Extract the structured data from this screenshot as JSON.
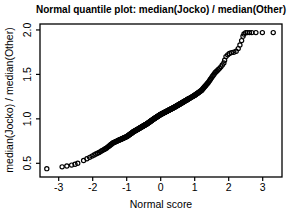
{
  "figure": {
    "background": "#ffffff",
    "box_color": "#000000",
    "marker_color": "#000000"
  },
  "chart_data": {
    "type": "scatter",
    "title": "Normal quantile plot: median(Jocko) / median(Other)",
    "xlabel": "Normal score",
    "ylabel": "median(Jocko) / median(Other)",
    "x_ticks": [
      -3,
      -2,
      -1,
      0,
      1,
      2,
      3
    ],
    "x_tick_labels": [
      "-3",
      "-2",
      "-1",
      "0",
      "1",
      "2",
      "3"
    ],
    "y_ticks": [
      0.5,
      1.0,
      1.5,
      2.0
    ],
    "y_tick_labels": [
      "0.5",
      "1.0",
      "1.5",
      "2.0"
    ],
    "xlim": [
      -3.55,
      3.57
    ],
    "ylim": [
      0.35,
      2.07
    ],
    "grid": false,
    "legend": null,
    "marker": "open-circle",
    "lower_outliers": [
      [
        -3.35,
        0.44
      ],
      [
        -2.9,
        0.46
      ],
      [
        -2.76,
        0.47
      ],
      [
        -2.62,
        0.48
      ],
      [
        -2.52,
        0.49
      ],
      [
        -2.44,
        0.5
      ]
    ],
    "upper_points": [
      [
        1.88,
        1.66
      ],
      [
        1.92,
        1.7
      ],
      [
        1.97,
        1.72
      ],
      [
        2.02,
        1.735
      ],
      [
        2.08,
        1.745
      ],
      [
        2.15,
        1.75
      ],
      [
        2.22,
        1.76
      ],
      [
        2.28,
        1.79
      ],
      [
        2.33,
        1.83
      ],
      [
        2.38,
        1.88
      ],
      [
        2.42,
        1.93
      ],
      [
        2.45,
        1.955
      ],
      [
        2.5,
        1.97
      ],
      [
        2.55,
        1.97
      ],
      [
        2.61,
        1.97
      ],
      [
        2.68,
        1.97
      ],
      [
        2.8,
        1.97
      ],
      [
        2.99,
        1.97
      ],
      [
        3.31,
        1.97
      ]
    ],
    "band": {
      "n_points": 300,
      "x_range": [
        -2.38,
        1.86
      ],
      "curve": [
        [
          -2.38,
          0.51
        ],
        [
          -2.2,
          0.545
        ],
        [
          -2.0,
          0.585
        ],
        [
          -1.8,
          0.625
        ],
        [
          -1.6,
          0.67
        ],
        [
          -1.5,
          0.7
        ],
        [
          -1.4,
          0.73
        ],
        [
          -1.2,
          0.765
        ],
        [
          -1.0,
          0.8
        ],
        [
          -0.8,
          0.855
        ],
        [
          -0.6,
          0.9
        ],
        [
          -0.4,
          0.945
        ],
        [
          -0.2,
          1.0
        ],
        [
          0.0,
          1.05
        ],
        [
          0.2,
          1.09
        ],
        [
          0.4,
          1.13
        ],
        [
          0.6,
          1.175
        ],
        [
          0.8,
          1.22
        ],
        [
          1.0,
          1.265
        ],
        [
          1.2,
          1.32
        ],
        [
          1.4,
          1.41
        ],
        [
          1.6,
          1.52
        ],
        [
          1.75,
          1.575
        ],
        [
          1.86,
          1.63
        ]
      ]
    }
  }
}
